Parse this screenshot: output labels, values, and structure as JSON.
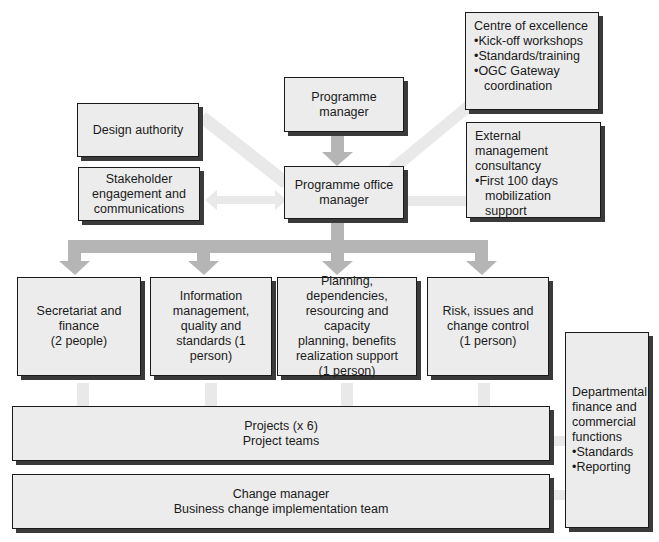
{
  "diagram": {
    "colors": {
      "box_fill": "#ececec",
      "box_border": "#1a1a1a",
      "shadow": "#3a3a3a",
      "arrow_dark": "#b3b3b3",
      "arrow_light": "#e6e6e6"
    },
    "programme_manager": {
      "lines": [
        "Programme",
        "manager"
      ]
    },
    "programme_office_manager": {
      "lines": [
        "Programme office",
        "manager"
      ]
    },
    "design_authority": {
      "lines": [
        "Design authority"
      ]
    },
    "stakeholder": {
      "lines": [
        "Stakeholder",
        "engagement and",
        "communications"
      ]
    },
    "centre_of_excellence": {
      "title": "Centre of excellence",
      "bullets": [
        "Kick-off workshops",
        "Standards/training",
        "OGC Gateway coordination"
      ]
    },
    "external_consultancy": {
      "title": "External management consultancy",
      "bullets": [
        "First 100 days mobilization support"
      ]
    },
    "secretariat": {
      "lines": [
        "Secretariat and",
        "finance",
        "(2 people)"
      ]
    },
    "information_management": {
      "lines": [
        "Information",
        "management,",
        "quality and",
        "standards (1 person)"
      ]
    },
    "planning": {
      "lines": [
        "Planning,",
        "dependencies,",
        "resourcing and capacity",
        "planning, benefits",
        "realization support",
        "(1 person)"
      ]
    },
    "risk": {
      "lines": [
        "Risk, issues and",
        "change control",
        "(1 person)"
      ]
    },
    "departmental": {
      "title": "Departmental finance and commercial functions",
      "bullets": [
        "Standards",
        "Reporting"
      ]
    },
    "projects": {
      "lines": [
        "Projects (x 6)",
        "Project teams"
      ]
    },
    "change_manager": {
      "lines": [
        "Change manager",
        "Business change implementation team"
      ]
    }
  }
}
